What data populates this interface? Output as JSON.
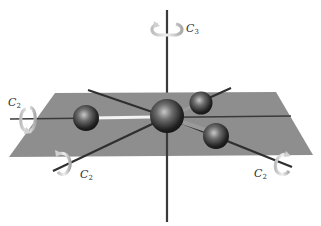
{
  "diagram": {
    "type": "molecular-symmetry",
    "colors": {
      "plane": "#8c8c8c",
      "axis": "#3a3a3a",
      "atom_dark": "#1a1a1a",
      "atom_light": "#b8b8b8",
      "arrow": "#d9d9d9",
      "background": "#ffffff"
    },
    "axes": [
      {
        "id": "c3",
        "label": "C",
        "subscript": "3",
        "orientation": "vertical"
      },
      {
        "id": "c2-left",
        "label": "C",
        "subscript": "2",
        "orientation": "horizontal"
      },
      {
        "id": "c2-front-left",
        "label": "C",
        "subscript": "2",
        "orientation": "diagonal"
      },
      {
        "id": "c2-front-right",
        "label": "C",
        "subscript": "2",
        "orientation": "diagonal"
      }
    ],
    "atoms": [
      {
        "id": "central",
        "role": "central-atom"
      },
      {
        "id": "left",
        "role": "ligand"
      },
      {
        "id": "upper-right",
        "role": "ligand"
      },
      {
        "id": "lower-right",
        "role": "ligand"
      }
    ]
  }
}
